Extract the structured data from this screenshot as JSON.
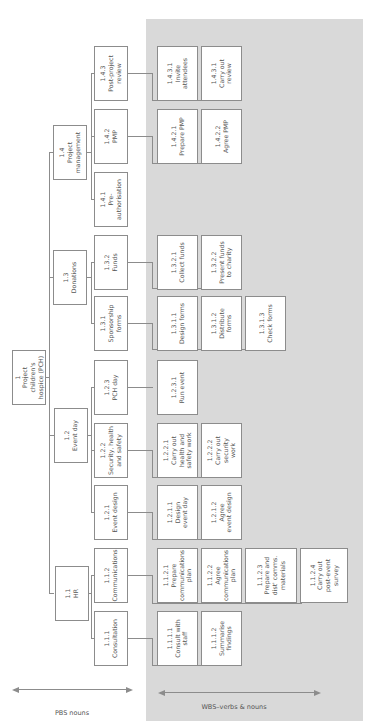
{
  "diagram": {
    "orientation": "rotated 90deg counter-clockwise",
    "colors": {
      "panel": "#d9d9d9",
      "box_border": "#8c8c8c",
      "text": "#555555"
    },
    "root": {
      "code": "1",
      "label": "Project children's\nhospice (PCH)"
    },
    "level2": [
      {
        "code": "1.1",
        "label": "HR"
      },
      {
        "code": "1.2",
        "label": "Event day"
      },
      {
        "code": "1.3",
        "label": "Donations"
      },
      {
        "code": "1.4",
        "label": "Project\nmanagement"
      }
    ],
    "level3": [
      {
        "code": "1.1.1",
        "label": "Consultation"
      },
      {
        "code": "1.1.2",
        "label": "Communications"
      },
      {
        "code": "1.2.1",
        "label": "Event design"
      },
      {
        "code": "1.2.2",
        "label": "Security, health\nand safety"
      },
      {
        "code": "1.2.3",
        "label": "PCH day"
      },
      {
        "code": "1.3.1",
        "label": "Sponsorship\nforms"
      },
      {
        "code": "1.3.2",
        "label": "Funds"
      },
      {
        "code": "1.4.1",
        "label": "Pre-\nauthorisation"
      },
      {
        "code": "1.4.2",
        "label": "PMP"
      },
      {
        "code": "1.4.3",
        "label": "Post-project\nreview"
      }
    ],
    "work_packages": [
      {
        "code": "1.1.1.1",
        "label": "Consult with\nstaff"
      },
      {
        "code": "1.1.1.2",
        "label": "Summarise\nfindings"
      },
      {
        "code": "1.1.2.1",
        "label": "Prepare\ncommunications\nplan"
      },
      {
        "code": "1.1.2.2",
        "label": "Agree\ncommunications\nplan"
      },
      {
        "code": "1.1.2.3",
        "label": "Prepare and\ndist' comms.\nmaterials"
      },
      {
        "code": "1.1.2.4",
        "label": "Carry out\npost-event\nsurvey"
      },
      {
        "code": "1.2.1.1",
        "label": "Design\nevent day"
      },
      {
        "code": "1.2.1.2",
        "label": "Agree\nevent design"
      },
      {
        "code": "1.2.2.1",
        "label": "Carry out\nhealth and\nsafety work"
      },
      {
        "code": "1.2.2.2",
        "label": "Carry out\nsecurity\nwork"
      },
      {
        "code": "1.2.3.1",
        "label": "Run event"
      },
      {
        "code": "1.3.1.1",
        "label": "Design forms"
      },
      {
        "code": "1.3.1.2",
        "label": "Distribute forms"
      },
      {
        "code": "1.3.1.3",
        "label": "Check forms"
      },
      {
        "code": "1.3.2.1",
        "label": "Collect funds"
      },
      {
        "code": "1.3.2.2",
        "label": "Present funds\nto charity"
      },
      {
        "code": "1.4.2.1",
        "label": "Prepare PMP"
      },
      {
        "code": "1.4.2.2",
        "label": "Agree PMP"
      },
      {
        "code": "1.4.3.1",
        "label": "Invite attendees"
      },
      {
        "code": "1.4.3.1",
        "label": "Carry out\nreview"
      }
    ],
    "axis_labels": {
      "pbs": "PBS nouns",
      "wbs": "WBS–verbs & nouns"
    }
  }
}
